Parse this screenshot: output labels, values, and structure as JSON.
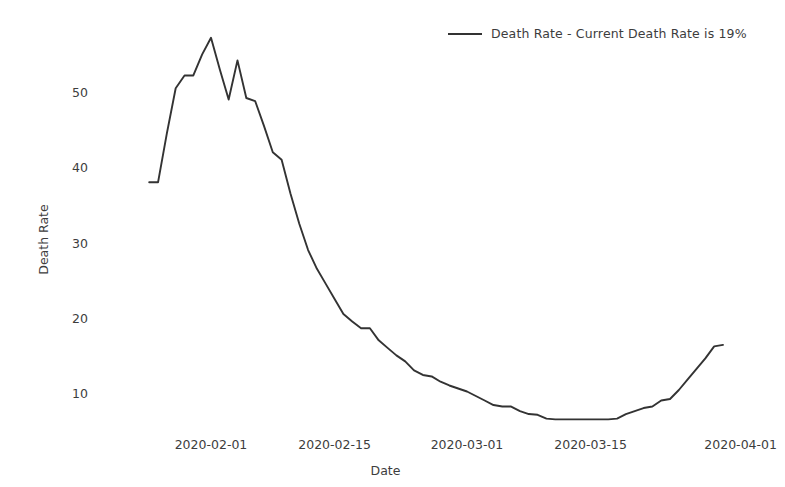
{
  "chart_data": {
    "type": "line",
    "title": "",
    "xlabel": "Date",
    "ylabel": "Death Rate",
    "grid": false,
    "legend_position": "top-right",
    "legend": [
      "Death Rate - Current Death Rate is 19%"
    ],
    "annotations": [
      "Current Death Rate is 19%"
    ],
    "xlim": [
      "2020-01-25",
      "2020-04-01"
    ],
    "ylim": [
      5,
      58
    ],
    "yticks": [
      10,
      20,
      30,
      40,
      50
    ],
    "ytick_labels": [
      "10",
      "20",
      "30",
      "40",
      "50"
    ],
    "xticks": [
      "2020-02-01",
      "2020-02-15",
      "2020-03-01",
      "2020-03-15",
      "2020-04-01"
    ],
    "xtick_labels": [
      "2020-02-01",
      "2020-02-15",
      "2020-03-01",
      "2020-03-15",
      "2020-04-01"
    ],
    "series": [
      {
        "name": "Death Rate",
        "color": "#333333",
        "x": [
          "2020-01-25",
          "2020-01-26",
          "2020-01-27",
          "2020-01-28",
          "2020-01-29",
          "2020-01-30",
          "2020-01-31",
          "2020-02-01",
          "2020-02-02",
          "2020-02-03",
          "2020-02-04",
          "2020-02-05",
          "2020-02-06",
          "2020-02-07",
          "2020-02-08",
          "2020-02-09",
          "2020-02-10",
          "2020-02-11",
          "2020-02-12",
          "2020-02-13",
          "2020-02-14",
          "2020-02-15",
          "2020-02-16",
          "2020-02-17",
          "2020-02-18",
          "2020-02-19",
          "2020-02-20",
          "2020-02-21",
          "2020-02-22",
          "2020-02-23",
          "2020-02-24",
          "2020-02-25",
          "2020-02-26",
          "2020-02-27",
          "2020-02-28",
          "2020-02-29",
          "2020-03-01",
          "2020-03-02",
          "2020-03-03",
          "2020-03-04",
          "2020-03-05",
          "2020-03-06",
          "2020-03-07",
          "2020-03-08",
          "2020-03-09",
          "2020-03-10",
          "2020-03-11",
          "2020-03-12",
          "2020-03-13",
          "2020-03-14",
          "2020-03-15",
          "2020-03-16",
          "2020-03-17",
          "2020-03-18",
          "2020-03-19",
          "2020-03-20",
          "2020-03-21",
          "2020-03-22",
          "2020-03-23",
          "2020-03-24",
          "2020-03-25",
          "2020-03-26",
          "2020-03-27",
          "2020-03-28",
          "2020-03-29",
          "2020-03-30"
        ],
        "values": [
          38.0,
          38.0,
          44.5,
          50.5,
          52.2,
          52.2,
          55.0,
          57.2,
          53.0,
          49.0,
          54.2,
          49.2,
          48.8,
          45.5,
          42.0,
          41.0,
          36.5,
          32.5,
          29.0,
          26.5,
          24.5,
          22.5,
          20.5,
          19.5,
          18.6,
          18.6,
          17.0,
          16.0,
          15.0,
          14.2,
          13.0,
          12.4,
          12.2,
          11.5,
          11.0,
          10.6,
          10.2,
          9.6,
          9.0,
          8.4,
          8.2,
          8.2,
          7.6,
          7.2,
          7.1,
          6.6,
          6.5,
          6.5,
          6.5,
          6.5,
          6.5,
          6.5,
          6.5,
          6.6,
          7.2,
          7.6,
          8.0,
          8.2,
          9.0,
          9.2,
          10.4,
          11.8,
          13.2,
          14.6,
          16.2,
          16.4
        ]
      }
    ]
  }
}
